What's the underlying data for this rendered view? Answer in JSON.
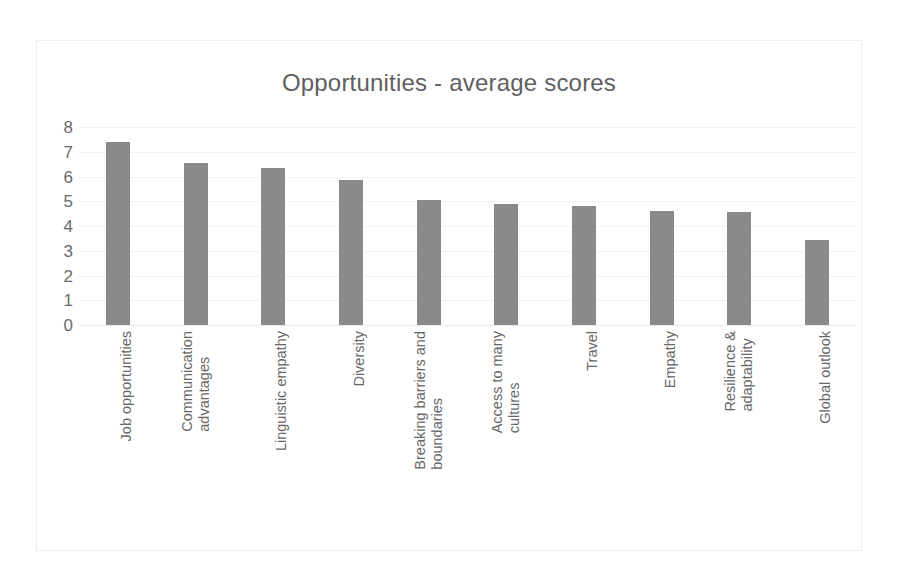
{
  "chart_data": {
    "type": "bar",
    "title": "Opportunities - average scores",
    "xlabel": "",
    "ylabel": "",
    "ylim": [
      0,
      8
    ],
    "ytick_labels": [
      "8",
      "7",
      "6",
      "5",
      "4",
      "3",
      "2",
      "1",
      "0"
    ],
    "yticks": [
      8,
      7,
      6,
      5,
      4,
      3,
      2,
      1,
      0
    ],
    "grid": true,
    "legend": false,
    "bar_color": "#8a8a8a",
    "categories": [
      "Job opportunities",
      "Communication advantages",
      "Linguistic empathy",
      "Diversity",
      "Breaking barriers and boundaries",
      "Access to many cultures",
      "Travel",
      "Empathy",
      "Resilience & adaptability",
      "Global outlook"
    ],
    "category_lines": [
      [
        "Job opportunities"
      ],
      [
        "Communication",
        "advantages"
      ],
      [
        "Linguistic empathy"
      ],
      [
        "Diversity"
      ],
      [
        "Breaking barriers and",
        "boundaries"
      ],
      [
        "Access to many",
        "cultures"
      ],
      [
        "Travel"
      ],
      [
        "Empathy"
      ],
      [
        "Resilience &",
        "adaptability"
      ],
      [
        "Global outlook"
      ]
    ],
    "values": [
      7.4,
      6.55,
      6.35,
      5.85,
      5.05,
      4.9,
      4.8,
      4.6,
      4.55,
      3.45
    ]
  }
}
